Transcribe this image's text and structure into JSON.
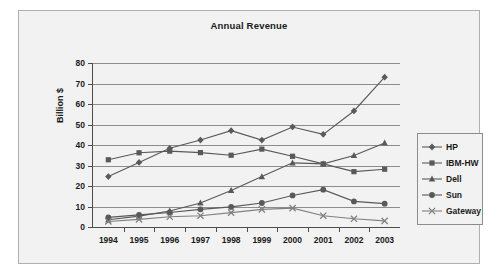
{
  "chart_data": {
    "type": "line",
    "title": "Annual Revenue",
    "xlabel": "",
    "ylabel": "Billion $",
    "categories": [
      "1994",
      "1995",
      "1996",
      "1997",
      "1998",
      "1999",
      "2000",
      "2001",
      "2002",
      "2003"
    ],
    "ylim": [
      0,
      80
    ],
    "yticks": [
      0,
      10,
      20,
      30,
      40,
      50,
      60,
      70,
      80
    ],
    "grid": true,
    "legend_position": "right",
    "series": [
      {
        "name": "HP",
        "marker": "diamond",
        "color": "#595959",
        "values": [
          24.6,
          31.5,
          38.4,
          42.4,
          47.0,
          42.4,
          48.8,
          45.2,
          56.6,
          73.1
        ]
      },
      {
        "name": "IBM-HW",
        "marker": "square",
        "color": "#595959",
        "values": [
          32.8,
          36.2,
          37.0,
          36.3,
          35.0,
          38.0,
          34.5,
          30.8,
          27.0,
          28.2
        ]
      },
      {
        "name": "Dell",
        "marker": "triangle",
        "color": "#595959",
        "values": [
          3.5,
          5.3,
          7.8,
          11.7,
          17.8,
          24.6,
          31.3,
          30.8,
          34.9,
          41.0
        ]
      },
      {
        "name": "Sun",
        "marker": "circle",
        "color": "#595959",
        "values": [
          4.7,
          5.9,
          7.1,
          8.6,
          9.8,
          11.7,
          15.4,
          18.2,
          12.5,
          11.4
        ]
      },
      {
        "name": "Gateway",
        "marker": "x",
        "color": "#808080",
        "values": [
          2.7,
          3.7,
          5.0,
          5.5,
          7.0,
          8.6,
          9.2,
          5.5,
          4.0,
          3.0
        ]
      }
    ]
  },
  "legend": {
    "items": [
      {
        "label": "HP"
      },
      {
        "label": "IBM-HW"
      },
      {
        "label": "Dell"
      },
      {
        "label": "Sun"
      },
      {
        "label": "Gateway"
      }
    ]
  },
  "colors": {
    "plot_background": "#f2f2f2",
    "gridline": "#8c8c8c",
    "axis": "#4d4d4d",
    "text": "#1a1a1a",
    "frame_border": "#b0b0b0"
  }
}
